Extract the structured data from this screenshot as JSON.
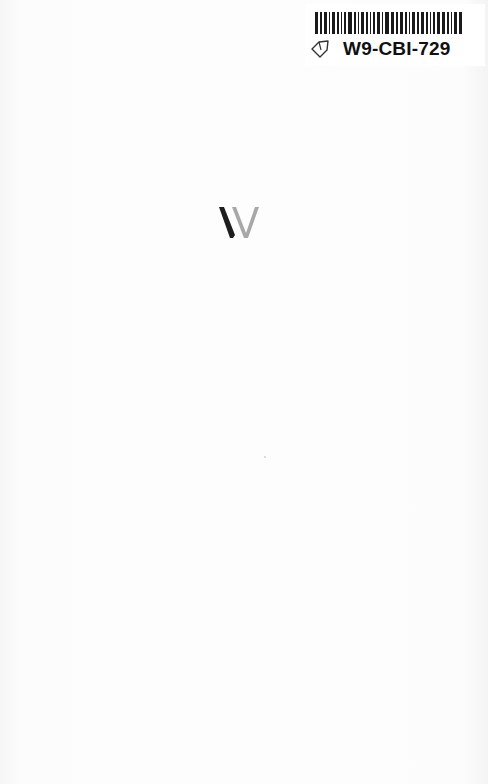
{
  "document": {
    "type": "book-front-endpaper",
    "background_color": "#fbfbfb"
  },
  "sticker": {
    "id_text": "W9-CBI-729",
    "barcode_bars": [
      3,
      2,
      3,
      1,
      3,
      2,
      1,
      2,
      4,
      2,
      1,
      3,
      2,
      1,
      2,
      3,
      1,
      4,
      3,
      2,
      3,
      2,
      1,
      3,
      2,
      3,
      2,
      1,
      2,
      3,
      3,
      2,
      1,
      3,
      3
    ],
    "icon": "tag-icon"
  },
  "logo": {
    "name": "publisher-w-logo",
    "dark_color": "#1e1e1e",
    "light_color": "#a8a8a8"
  }
}
